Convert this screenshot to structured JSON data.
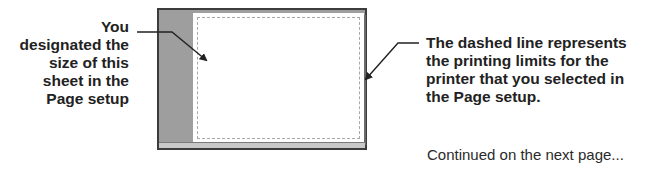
{
  "left_callout": {
    "lines": [
      "You",
      "designated the",
      "size of this",
      "sheet in the",
      "Page setup"
    ]
  },
  "right_callout": {
    "lines": [
      "The dashed line represents",
      "the printing limits for the",
      "printer that you selected in",
      "the Page setup."
    ]
  },
  "footer": {
    "continued": "Continued on the next page..."
  },
  "illustration": {
    "frame_color": "#3c3c3c",
    "workspace_color": "#9e9e9e",
    "page_color": "#ffffff",
    "dashed_color": "#a8a8a8"
  }
}
